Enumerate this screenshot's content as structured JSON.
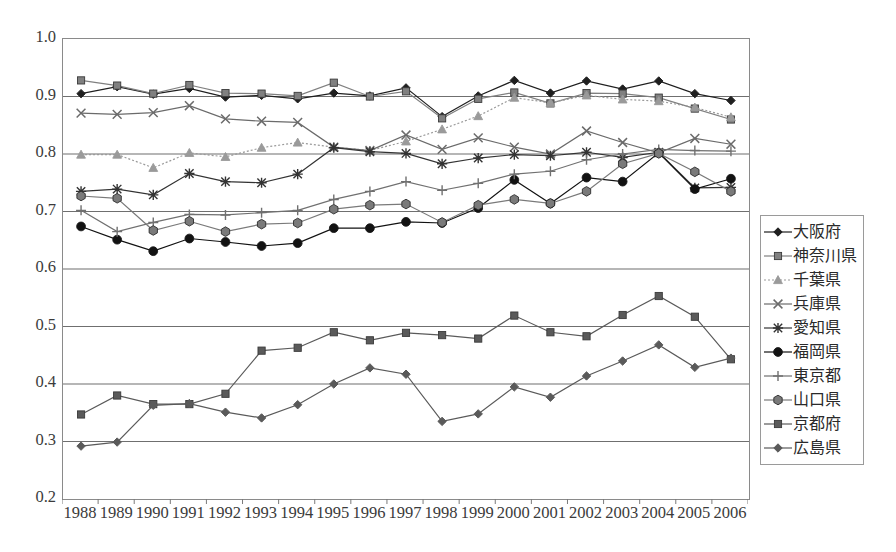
{
  "chart_data": {
    "type": "line",
    "title": "",
    "xlabel": "",
    "ylabel": "",
    "xlim_categories": true,
    "ylim": [
      0.2,
      1.0
    ],
    "ytick_step": 0.1,
    "grid": "horizontal",
    "legend_position": "right",
    "categories": [
      "1988",
      "1989",
      "1990",
      "1991",
      "1992",
      "1993",
      "1994",
      "1995",
      "1996",
      "1997",
      "1998",
      "1999",
      "2000",
      "2001",
      "2002",
      "2003",
      "2004",
      "2005",
      "2006"
    ],
    "yticks": [
      "1.0",
      "0.9",
      "0.8",
      "0.7",
      "0.6",
      "0.5",
      "0.4",
      "0.3",
      "0.2"
    ],
    "series": [
      {
        "name": "大阪府",
        "marker": "diamond",
        "color": "#1f1f1f",
        "dash": "solid",
        "values": [
          0.905,
          0.917,
          0.904,
          0.914,
          0.899,
          0.902,
          0.896,
          0.906,
          0.901,
          0.915,
          0.865,
          0.901,
          0.928,
          0.906,
          0.927,
          0.913,
          0.927,
          0.905,
          0.893
        ]
      },
      {
        "name": "神奈川県",
        "marker": "square",
        "color": "#808080",
        "dash": "solid",
        "values": [
          0.928,
          0.919,
          0.905,
          0.92,
          0.906,
          0.905,
          0.901,
          0.924,
          0.9,
          0.909,
          0.862,
          0.896,
          0.907,
          0.888,
          0.906,
          0.905,
          0.898,
          0.879,
          0.86
        ]
      },
      {
        "name": "千葉県",
        "marker": "triangle",
        "color": "#9a9a9a",
        "dash": "dotted",
        "values": [
          0.799,
          0.799,
          0.776,
          0.802,
          0.795,
          0.811,
          0.82,
          0.812,
          0.806,
          0.822,
          0.843,
          0.866,
          0.898,
          0.889,
          0.902,
          0.895,
          0.892,
          0.881,
          0.864
        ]
      },
      {
        "name": "兵庫県",
        "marker": "x",
        "color": "#6b6b6b",
        "dash": "solid",
        "values": [
          0.871,
          0.869,
          0.872,
          0.884,
          0.861,
          0.857,
          0.855,
          0.812,
          0.806,
          0.833,
          0.808,
          0.828,
          0.812,
          0.8,
          0.84,
          0.82,
          0.802,
          0.827,
          0.817
        ]
      },
      {
        "name": "愛知県",
        "marker": "star",
        "color": "#333333",
        "dash": "solid",
        "values": [
          0.735,
          0.739,
          0.729,
          0.766,
          0.752,
          0.75,
          0.765,
          0.811,
          0.804,
          0.801,
          0.783,
          0.793,
          0.799,
          0.797,
          0.803,
          0.794,
          0.803,
          0.741,
          0.742
        ]
      },
      {
        "name": "福岡県",
        "marker": "circle",
        "color": "#121212",
        "dash": "solid",
        "values": [
          0.674,
          0.651,
          0.631,
          0.653,
          0.647,
          0.64,
          0.645,
          0.671,
          0.671,
          0.682,
          0.68,
          0.706,
          0.755,
          0.714,
          0.759,
          0.752,
          0.802,
          0.739,
          0.757
        ]
      },
      {
        "name": "東京都",
        "marker": "plus",
        "color": "#707070",
        "dash": "solid",
        "values": [
          0.702,
          0.665,
          0.681,
          0.695,
          0.694,
          0.698,
          0.702,
          0.721,
          0.735,
          0.752,
          0.737,
          0.749,
          0.765,
          0.77,
          0.79,
          0.8,
          0.808,
          0.806,
          0.805
        ]
      },
      {
        "name": "山口県",
        "marker": "hexagon",
        "color": "#7a7a7a",
        "dash": "solid",
        "values": [
          0.727,
          0.723,
          0.667,
          0.683,
          0.665,
          0.678,
          0.68,
          0.704,
          0.711,
          0.713,
          0.681,
          0.711,
          0.721,
          0.714,
          0.735,
          0.783,
          0.801,
          0.769,
          0.735
        ]
      },
      {
        "name": "京都府",
        "marker": "square",
        "color": "#5a5a5a",
        "dash": "solid",
        "values": [
          0.347,
          0.38,
          0.365,
          0.365,
          0.383,
          0.458,
          0.463,
          0.49,
          0.476,
          0.489,
          0.485,
          0.479,
          0.519,
          0.49,
          0.483,
          0.52,
          0.553,
          0.517,
          0.443
        ]
      },
      {
        "name": "広島県",
        "marker": "diamond",
        "color": "#5a5a5a",
        "dash": "solid",
        "values": [
          0.292,
          0.299,
          0.363,
          0.366,
          0.351,
          0.341,
          0.364,
          0.4,
          0.428,
          0.417,
          0.335,
          0.348,
          0.395,
          0.377,
          0.414,
          0.44,
          0.468,
          0.429,
          0.445
        ]
      }
    ]
  }
}
